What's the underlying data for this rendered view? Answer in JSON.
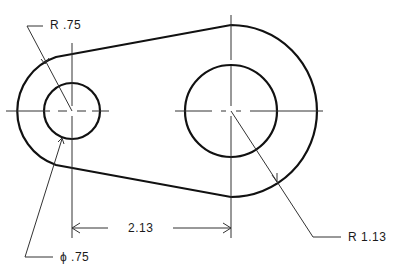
{
  "drawing": {
    "type": "engineering-drawing",
    "subject": "link plate with two holes",
    "colors": {
      "object_line": "#111111",
      "thin_line": "#333333",
      "background": "#ffffff"
    }
  },
  "dimensions": {
    "left_outer_radius": "R .75",
    "left_hole_diameter": "ϕ .75",
    "center_distance": "2.13",
    "right_outer_radius": "R 1.13"
  },
  "geometry": {
    "left_center": [
      72,
      111
    ],
    "right_center": [
      231,
      111
    ],
    "left_hole_r": 28,
    "left_outer_r": 57,
    "right_hole_r": 46,
    "right_outer_r": 86
  }
}
